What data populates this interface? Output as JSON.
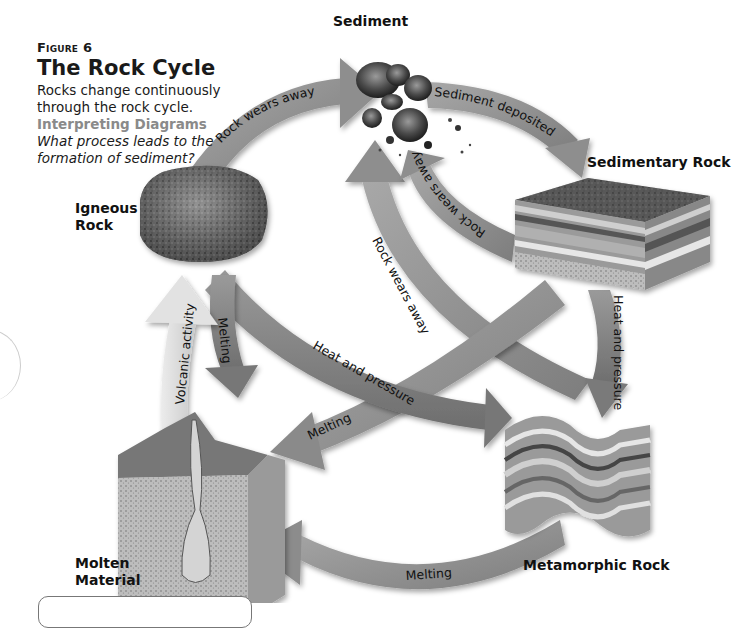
{
  "figure": {
    "label": "Figure 6",
    "title": "The Rock Cycle",
    "description": "Rocks change continuously through the rock cycle.",
    "interpreting_label": "Interpreting Diagrams",
    "question": "What process leads to the formation of sediment?"
  },
  "nodes": {
    "sediment": "Sediment",
    "sedimentary_rock": "Sedimentary Rock",
    "igneous_rock_line1": "Igneous",
    "igneous_rock_line2": "Rock",
    "molten_material_line1": "Molten",
    "molten_material_line2": "Material",
    "metamorphic_rock": "Metamorphic Rock"
  },
  "arrows": {
    "igneous_to_sediment": "Rock wears away",
    "sediment_to_sedimentary": "Sediment deposited",
    "sedimentary_to_sediment": "Rock wears away",
    "metamorphic_to_sediment": "Rock wears away",
    "igneous_to_metamorphic": "Heat and pressure",
    "sedimentary_to_metamorphic": "Heat and pressure",
    "sedimentary_to_molten": "Melting",
    "igneous_to_molten": "Melting",
    "molten_to_igneous": "Volcanic activity",
    "metamorphic_to_molten": "Melting"
  },
  "colors": {
    "arrow_dark": "#7a7a7a",
    "arrow_mid": "#8e8e8e",
    "arrow_light": "#d9d9d9",
    "text": "#111111",
    "interp_label": "#8a8a8a"
  }
}
